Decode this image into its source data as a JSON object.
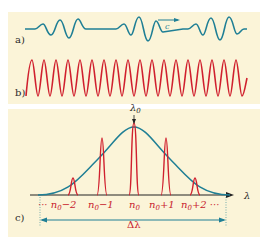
{
  "panels": {
    "a": {
      "label": "a)",
      "wave_color": "#1f7f95",
      "arrow_label": "c"
    },
    "b": {
      "label": "b)",
      "wave_color": "#d0202e"
    },
    "c": {
      "label": "c)",
      "peak_label": "λ",
      "peak_label_sub": "0",
      "axis_label": "λ",
      "width_label": "Δλ",
      "envelope_color": "#1f7f95",
      "mode_color": "#d0202e",
      "modes": [
        {
          "base": "n",
          "sub": "0",
          "suffix": "−2",
          "prefix": "··· "
        },
        {
          "base": "n",
          "sub": "0",
          "suffix": "−1",
          "prefix": ""
        },
        {
          "base": "n",
          "sub": "0",
          "suffix": "",
          "prefix": ""
        },
        {
          "base": "n",
          "sub": "0",
          "suffix": "+1",
          "prefix": ""
        },
        {
          "base": "n",
          "sub": "0",
          "suffix": "+2 ···",
          "prefix": ""
        }
      ]
    }
  }
}
